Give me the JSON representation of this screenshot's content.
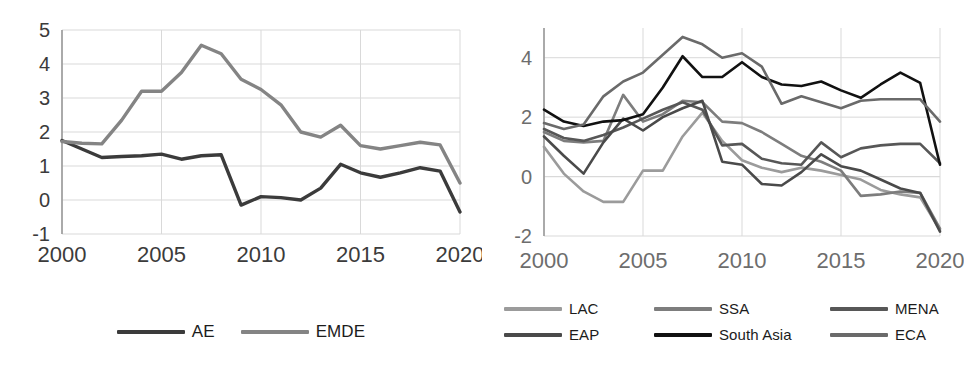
{
  "chart_data": [
    {
      "id": "left",
      "type": "line",
      "title": "",
      "xlabel": "",
      "ylabel": "",
      "xlim": [
        2000,
        2020
      ],
      "ylim": [
        -1,
        5
      ],
      "yticks": [
        -1,
        0,
        1,
        2,
        3,
        4,
        5
      ],
      "xticks": [
        2000,
        2005,
        2010,
        2015,
        2020
      ],
      "xticklabels": [
        "2000",
        "2005",
        "2010",
        "2015",
        "2020"
      ],
      "yticklabels": [
        "-1",
        "0",
        "1",
        "2",
        "3",
        "4",
        "5"
      ],
      "grid": true,
      "legend_position": "bottom",
      "x": [
        2000,
        2001,
        2002,
        2003,
        2004,
        2005,
        2006,
        2007,
        2008,
        2009,
        2010,
        2011,
        2012,
        2013,
        2014,
        2015,
        2016,
        2017,
        2018,
        2019,
        2020
      ],
      "series": [
        {
          "name": "AE",
          "color": "#3b3b3b",
          "values": [
            1.75,
            1.5,
            1.25,
            1.28,
            1.3,
            1.35,
            1.2,
            1.3,
            1.33,
            -0.15,
            0.1,
            0.07,
            0.0,
            0.35,
            1.05,
            0.8,
            0.67,
            0.8,
            0.95,
            0.85,
            -0.35
          ]
        },
        {
          "name": "EMDE",
          "color": "#848484",
          "values": [
            1.72,
            1.67,
            1.65,
            2.35,
            3.2,
            3.2,
            3.75,
            4.55,
            4.3,
            3.55,
            3.25,
            2.8,
            2.0,
            1.85,
            2.2,
            1.6,
            1.5,
            1.6,
            1.7,
            1.62,
            0.5
          ]
        }
      ]
    },
    {
      "id": "right",
      "type": "line",
      "title": "",
      "xlabel": "",
      "ylabel": "",
      "xlim": [
        2000,
        2020
      ],
      "ylim": [
        -2,
        5
      ],
      "yticks": [
        -2,
        0,
        2,
        4
      ],
      "xticks": [
        2000,
        2005,
        2010,
        2015,
        2020
      ],
      "xticklabels": [
        "2000",
        "2005",
        "2010",
        "2015",
        "2020"
      ],
      "yticklabels": [
        "-2",
        "0",
        "2",
        "4"
      ],
      "grid": true,
      "legend_position": "bottom",
      "x": [
        2000,
        2001,
        2002,
        2003,
        2004,
        2005,
        2006,
        2007,
        2008,
        2009,
        2010,
        2011,
        2012,
        2013,
        2014,
        2015,
        2016,
        2017,
        2018,
        2019,
        2020
      ],
      "series": [
        {
          "name": "LAC",
          "color": "#9b9b9b",
          "values": [
            1.0,
            0.1,
            -0.5,
            -0.85,
            -0.85,
            0.2,
            0.2,
            1.35,
            2.15,
            1.2,
            0.55,
            0.3,
            0.15,
            0.3,
            0.2,
            0.05,
            -0.1,
            -0.45,
            -0.6,
            -0.7,
            -1.8
          ]
        },
        {
          "name": "SSA",
          "color": "#7d7d7d",
          "values": [
            1.5,
            1.2,
            1.15,
            1.2,
            2.75,
            1.85,
            2.1,
            2.55,
            2.5,
            1.85,
            1.8,
            1.5,
            1.1,
            0.7,
            0.5,
            0.2,
            -0.65,
            -0.6,
            -0.5,
            -0.55,
            -1.75
          ]
        },
        {
          "name": "MENA",
          "color": "#575757",
          "values": [
            1.6,
            1.3,
            1.2,
            1.4,
            1.65,
            1.95,
            2.25,
            2.5,
            2.25,
            1.05,
            1.1,
            0.6,
            0.45,
            0.4,
            1.15,
            0.65,
            0.95,
            1.05,
            1.1,
            1.1,
            0.45
          ]
        },
        {
          "name": "EAP",
          "color": "#4a4a4a",
          "values": [
            1.35,
            0.7,
            0.1,
            1.15,
            1.95,
            1.55,
            2.0,
            2.3,
            2.55,
            0.5,
            0.4,
            -0.25,
            -0.3,
            0.15,
            0.75,
            0.35,
            0.2,
            -0.1,
            -0.4,
            -0.55,
            -1.85
          ]
        },
        {
          "name": "South Asia",
          "color": "#111111",
          "values": [
            2.25,
            1.85,
            1.7,
            1.85,
            1.9,
            2.1,
            3.0,
            4.05,
            3.35,
            3.35,
            3.85,
            3.35,
            3.1,
            3.05,
            3.2,
            2.9,
            2.65,
            3.1,
            3.5,
            3.15,
            0.4
          ]
        },
        {
          "name": "ECA",
          "color": "#6a6a6a",
          "values": [
            1.8,
            1.6,
            1.75,
            2.7,
            3.2,
            3.5,
            4.1,
            4.7,
            4.45,
            4.0,
            4.15,
            3.7,
            2.45,
            2.7,
            2.5,
            2.3,
            2.55,
            2.6,
            2.6,
            2.6,
            1.85
          ]
        }
      ]
    }
  ],
  "left_chart": {
    "legend": [
      {
        "label": "AE",
        "color": "#3b3b3b"
      },
      {
        "label": "EMDE",
        "color": "#848484"
      }
    ],
    "y_ticks": [
      "5",
      "4",
      "3",
      "2",
      "1",
      "0",
      "-1"
    ],
    "x_ticks": [
      "2000",
      "2005",
      "2010",
      "2015",
      "2020"
    ]
  },
  "right_chart": {
    "legend": [
      {
        "label": "LAC",
        "color": "#9b9b9b"
      },
      {
        "label": "SSA",
        "color": "#7d7d7d"
      },
      {
        "label": "MENA",
        "color": "#575757"
      },
      {
        "label": "EAP",
        "color": "#4a4a4a"
      },
      {
        "label": "South Asia",
        "color": "#111111"
      },
      {
        "label": "ECA",
        "color": "#6a6a6a"
      }
    ],
    "y_ticks": [
      "4",
      "2",
      "0",
      "-2"
    ],
    "x_ticks": [
      "2000",
      "2005",
      "2010",
      "2015",
      "2020"
    ]
  }
}
